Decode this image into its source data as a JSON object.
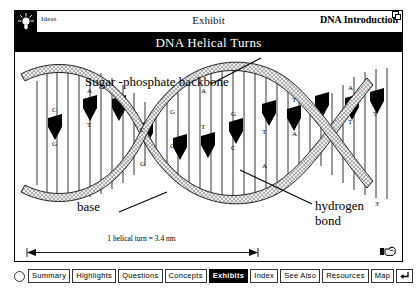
{
  "window": {
    "header": {
      "ideas_label": "Ideas",
      "ideas_icon": "lightbulb-icon",
      "center_title": "Exhibit",
      "right_title": "DNA Introduction",
      "resize_icon": "window-resize-icon"
    },
    "banner_title": "DNA Helical Turns"
  },
  "diagram": {
    "labels": {
      "backbone": "Sugar -phosphate backbone",
      "base": "base",
      "hydrogen_bond_line1": "hydrogen",
      "hydrogen_bond_line2": "bond",
      "end_5_prime": "5'",
      "end_3_prime": "3'",
      "scale": "1 helical turn = 3.4 nm"
    },
    "base_pairs": [
      {
        "top": "C",
        "bottom": "G"
      },
      {
        "top": "A",
        "bottom": "T"
      },
      {
        "top": "A",
        "bottom": "T"
      },
      {
        "top": "G",
        "bottom": "C"
      },
      {
        "top": "T",
        "bottom": "A"
      },
      {
        "top": "C",
        "bottom": "G"
      },
      {
        "top": "G",
        "bottom": "C"
      },
      {
        "top": "T",
        "bottom": "A"
      },
      {
        "top": "A",
        "bottom": "T"
      }
    ],
    "hand_cursor_icon": "pointing-hand-icon",
    "colors": {
      "ink": "#000000",
      "paper": "#ffffff",
      "ribbon_fill": "#c9c9c9"
    }
  },
  "nav": {
    "radio_icon": "radio-circle-icon",
    "items": [
      {
        "label": "Summary",
        "selected": false
      },
      {
        "label": "Highlights",
        "selected": false
      },
      {
        "label": "Questions",
        "selected": false
      },
      {
        "label": "Concepts",
        "selected": false
      },
      {
        "label": "Exhibits",
        "selected": true
      },
      {
        "label": "Index",
        "selected": false
      },
      {
        "label": "See Also",
        "selected": false
      },
      {
        "label": "Resources",
        "selected": false
      },
      {
        "label": "Map",
        "selected": false
      }
    ],
    "return_icon": "return-arrow-icon"
  }
}
